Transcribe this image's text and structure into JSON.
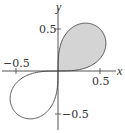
{
  "chart_data": {
    "type": "line",
    "title": "",
    "equation": "r^2 = 0.5 sin(2θ)",
    "xlabel": "x",
    "ylabel": "y",
    "xlim": [
      -0.7,
      0.75
    ],
    "ylim": [
      -0.72,
      0.85
    ],
    "x_ticks": [
      -0.5,
      0.5
    ],
    "y_ticks": [
      0.5,
      -0.5
    ],
    "x_tick_labels": [
      "−0.5",
      "0.5"
    ],
    "y_tick_labels": [
      "0.5",
      "−0.5"
    ],
    "shaded_region": "first-quadrant loop",
    "grid": false,
    "colors": {
      "curve": "#555555",
      "fill": "#d4d4d4",
      "axis": "#444444"
    }
  }
}
